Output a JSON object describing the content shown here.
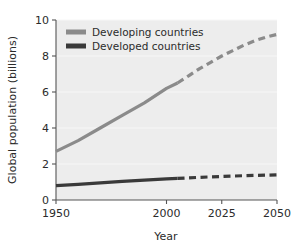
{
  "chart_data": {
    "type": "line",
    "title": "",
    "xlabel": "Year",
    "ylabel": "Global population (billions)",
    "xlim": [
      1950,
      2050
    ],
    "ylim": [
      0,
      10
    ],
    "xticks": [
      1950,
      2000,
      2025,
      2050
    ],
    "xtick_labels": [
      "1950",
      "2000",
      "2025",
      "2050"
    ],
    "yticks": [
      0,
      2,
      4,
      6,
      8,
      10
    ],
    "ytick_labels": [
      "0",
      "2",
      "4",
      "6",
      "8",
      "10"
    ],
    "grid": "horizontal-faint",
    "legend_position": "top-left-inside",
    "projection_start_year": 2005,
    "series": [
      {
        "name": "Developing countries",
        "color": "#8b8b8b",
        "historical": {
          "x": [
            1950,
            1960,
            1970,
            1980,
            1990,
            2000,
            2005
          ],
          "y": [
            2.7,
            3.3,
            4.0,
            4.7,
            5.4,
            6.2,
            6.5
          ]
        },
        "projected": {
          "x": [
            2005,
            2010,
            2015,
            2020,
            2025,
            2030,
            2035,
            2040,
            2045,
            2050
          ],
          "y": [
            6.5,
            6.9,
            7.3,
            7.65,
            8.0,
            8.3,
            8.6,
            8.85,
            9.05,
            9.2
          ]
        }
      },
      {
        "name": "Developed countries",
        "color": "#3a3a3a",
        "historical": {
          "x": [
            1950,
            1960,
            1970,
            1980,
            1990,
            2000,
            2005
          ],
          "y": [
            0.8,
            0.87,
            0.95,
            1.03,
            1.1,
            1.17,
            1.2
          ]
        },
        "projected": {
          "x": [
            2005,
            2015,
            2025,
            2035,
            2045,
            2050
          ],
          "y": [
            1.2,
            1.26,
            1.31,
            1.35,
            1.38,
            1.4
          ]
        }
      }
    ]
  },
  "legend": {
    "items": [
      {
        "label": "Developing countries",
        "swatch_color": "#8b8b8b"
      },
      {
        "label": "Developed countries",
        "swatch_color": "#3a3a3a"
      }
    ]
  },
  "axes": {
    "x_title": "Year",
    "y_title": "Global population (billions)"
  },
  "colors": {
    "plot_background": "#ededed",
    "axis_line": "#555555",
    "gridline": "#f7f7f7",
    "text": "#2b2b2b",
    "developing": "#8b8b8b",
    "developed": "#3a3a3a"
  }
}
